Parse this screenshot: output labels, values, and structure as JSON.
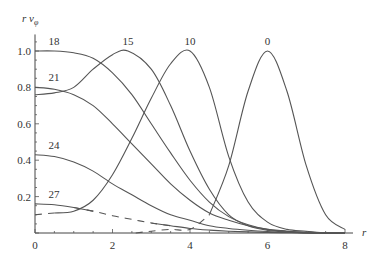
{
  "chart_data": {
    "type": "line",
    "title": "",
    "xlabel": "r",
    "ylabel": "r v_φ",
    "ylabel_display": "r v",
    "ylabel_subscript": "φ",
    "xlim": [
      0,
      8
    ],
    "ylim": [
      0,
      1.08
    ],
    "grid": false,
    "xticks": [
      0,
      2,
      4,
      6,
      8
    ],
    "xtick_labels": [
      "0",
      "2",
      "4",
      "6",
      "8"
    ],
    "yticks": [
      0.2,
      0.4,
      0.6,
      0.8,
      1.0
    ],
    "ytick_labels": [
      "0.2",
      "0.4",
      "0.6",
      "0.8",
      "1.0"
    ],
    "series": [
      {
        "name": "0",
        "label": "0",
        "label_at": [
          6.0,
          1.0
        ],
        "x": [
          2.6,
          3.0,
          3.5,
          4.0,
          4.5,
          5.0,
          5.5,
          6.0,
          6.5,
          7.0,
          7.5,
          8.0
        ],
        "y": [
          0.0,
          0.01,
          0.02,
          0.02,
          0.1,
          0.37,
          0.78,
          1.0,
          0.78,
          0.37,
          0.1,
          0.02
        ],
        "dashed_until": 4.6
      },
      {
        "name": "10",
        "label": "10",
        "label_at": [
          4.0,
          1.0
        ],
        "x": [
          0.0,
          0.5,
          1.0,
          1.5,
          2.0,
          2.5,
          3.0,
          3.5,
          4.0,
          4.5,
          5.0,
          5.5,
          6.0,
          6.5,
          7.0,
          7.5,
          8.0
        ],
        "y": [
          0.1,
          0.11,
          0.12,
          0.18,
          0.32,
          0.52,
          0.74,
          0.93,
          1.0,
          0.8,
          0.42,
          0.17,
          0.06,
          0.02,
          0.01,
          0.0,
          0.0
        ],
        "dashed_until": 0.95
      },
      {
        "name": "15",
        "label": "15",
        "label_at": [
          2.4,
          1.0
        ],
        "x": [
          0.0,
          0.5,
          1.0,
          1.5,
          2.0,
          2.4,
          3.0,
          3.5,
          4.0,
          4.5,
          5.0,
          5.5,
          6.0,
          6.5,
          7.0,
          7.5,
          8.0
        ],
        "y": [
          0.76,
          0.77,
          0.8,
          0.9,
          0.98,
          1.0,
          0.9,
          0.7,
          0.45,
          0.24,
          0.1,
          0.04,
          0.015,
          0.005,
          0.0,
          0.0,
          0.0
        ],
        "dashed_until": null
      },
      {
        "name": "18",
        "label": "18",
        "label_at": [
          0.35,
          1.0
        ],
        "x": [
          0.0,
          0.5,
          1.0,
          1.5,
          2.0,
          2.5,
          3.0,
          3.5,
          4.0,
          4.5,
          5.0,
          5.5,
          6.0,
          6.5,
          7.0,
          7.5,
          8.0
        ],
        "y": [
          1.0,
          1.0,
          0.99,
          0.96,
          0.88,
          0.76,
          0.6,
          0.44,
          0.29,
          0.17,
          0.09,
          0.045,
          0.02,
          0.01,
          0.0,
          0.0,
          0.0
        ],
        "dashed_until": null
      },
      {
        "name": "21",
        "label": "21",
        "label_at": [
          0.35,
          0.8
        ],
        "x": [
          0.0,
          0.5,
          1.0,
          1.5,
          2.0,
          2.5,
          3.0,
          3.5,
          4.0,
          4.5,
          5.0,
          5.5,
          6.0,
          6.5,
          7.0,
          7.5,
          8.0
        ],
        "y": [
          0.8,
          0.79,
          0.76,
          0.7,
          0.6,
          0.49,
          0.38,
          0.27,
          0.18,
          0.11,
          0.07,
          0.04,
          0.02,
          0.01,
          0.005,
          0.0,
          0.0
        ],
        "dashed_until": null
      },
      {
        "name": "24",
        "label": "24",
        "label_at": [
          0.35,
          0.43
        ],
        "x": [
          0.0,
          0.5,
          1.0,
          1.5,
          2.0,
          2.5,
          3.0,
          3.5,
          4.0,
          4.5,
          5.0,
          5.5,
          6.0,
          6.5,
          7.0,
          7.5,
          8.0
        ],
        "y": [
          0.43,
          0.42,
          0.39,
          0.34,
          0.27,
          0.21,
          0.15,
          0.1,
          0.07,
          0.04,
          0.025,
          0.015,
          0.008,
          0.004,
          0.002,
          0.0,
          0.0
        ],
        "dashed_until": null
      },
      {
        "name": "27",
        "label": "27",
        "label_at": [
          0.35,
          0.16
        ],
        "x": [
          0.0,
          0.5,
          1.0,
          1.5,
          2.0,
          2.5,
          3.0,
          3.5,
          4.0,
          4.5,
          5.0,
          5.5,
          6.0,
          6.5,
          7.0,
          7.5,
          8.0
        ],
        "y": [
          0.16,
          0.155,
          0.14,
          0.12,
          0.095,
          0.075,
          0.055,
          0.04,
          0.025,
          0.016,
          0.01,
          0.006,
          0.003,
          0.002,
          0.001,
          0.0,
          0.0
        ],
        "dashed_from": 1.2,
        "dashed_to": 3.0
      }
    ]
  }
}
